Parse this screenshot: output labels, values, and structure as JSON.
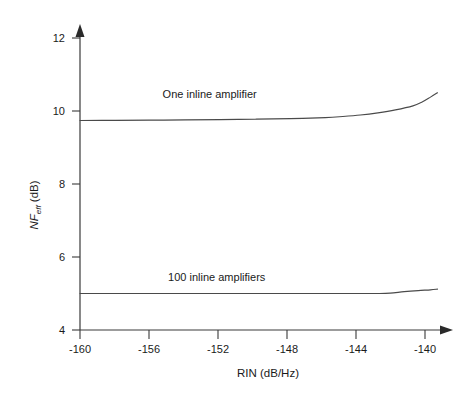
{
  "chart_data": {
    "type": "line",
    "title": "",
    "xlabel": "RIN (dB/Hz)",
    "ylabel": "NF_eff (dB)",
    "ylabel_parts": {
      "main": "NF",
      "subscript": "eff",
      "unit": " (dB)"
    },
    "xlim": [
      -160,
      -139
    ],
    "ylim": [
      4,
      12
    ],
    "xticks": [
      -160,
      -156,
      -152,
      -148,
      -144,
      -140
    ],
    "xticklabels": [
      "-160",
      "-156",
      "-152",
      "-148",
      "-144",
      "-140"
    ],
    "yticks": [
      4,
      6,
      8,
      10,
      12
    ],
    "yticklabels": [
      "4",
      "6",
      "8",
      "10",
      "12"
    ],
    "grid": false,
    "legend_position": "inline-annotations",
    "series": [
      {
        "name": "One inline amplifier",
        "annotation": "One inline amplifier",
        "annotation_x": -152.6,
        "annotation_y": 10.35,
        "x": [
          -160,
          -158,
          -156,
          -154,
          -152,
          -150,
          -148,
          -146,
          -145,
          -144,
          -143,
          -142,
          -141,
          -140.5,
          -140,
          -139.6
        ],
        "y": [
          9.74,
          9.745,
          9.75,
          9.755,
          9.765,
          9.775,
          9.79,
          9.82,
          9.85,
          9.89,
          9.95,
          10.03,
          10.14,
          10.24,
          10.38,
          10.5
        ]
      },
      {
        "name": "100 inline amplifiers",
        "annotation": "100 inline amplifiers",
        "annotation_x": -152.2,
        "annotation_y": 5.35,
        "x": [
          -160,
          -157,
          -154,
          -151,
          -148,
          -146,
          -144,
          -143,
          -142.3,
          -141.5,
          -140.7,
          -140,
          -139.6
        ],
        "y": [
          5.0,
          5.0,
          5.0,
          5.0,
          5.0,
          5.0,
          5.0,
          5.0,
          5.01,
          5.05,
          5.08,
          5.1,
          5.12
        ]
      }
    ],
    "axis_color": "#3a3a3a",
    "curve_color": "#4a4a4a",
    "background_color": "#ffffff"
  },
  "figure": {
    "plot_left_px": 80,
    "plot_bottom_px": 330,
    "plot_right_px": 448,
    "plot_top_px": 30
  }
}
